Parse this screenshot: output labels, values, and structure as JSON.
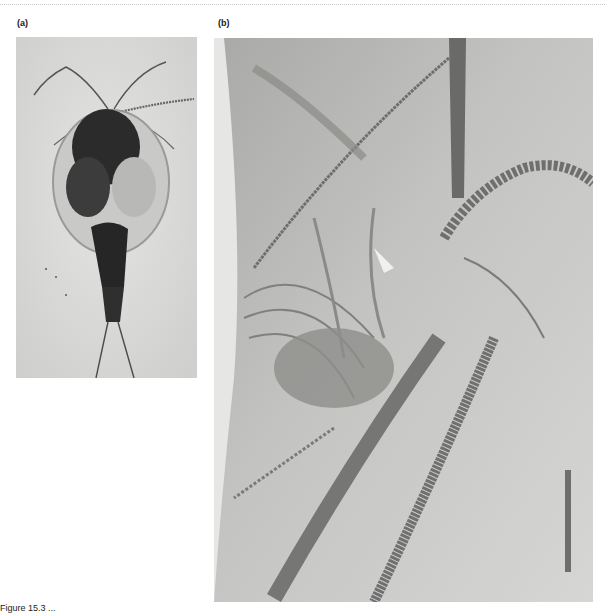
{
  "page": {
    "header_rule": "dotted"
  },
  "figure": {
    "panels": [
      {
        "label": "(a)",
        "description": "Micrograph of whole copepod, dorsal view, light background",
        "position": "left"
      },
      {
        "label": "(b)",
        "description": "Close-up micrograph of copepod antennae and setae with scale bar",
        "position": "right",
        "scale_bar": true
      }
    ],
    "caption": "Figure 15.3  ..."
  },
  "colors": {
    "page_background": "#ffffff",
    "photo_a_background": "#d8d8d6",
    "photo_b_background": "#bdbdbb",
    "specimen_dark": "#2a2a2a",
    "scale_bar": "#6e6e6e"
  }
}
